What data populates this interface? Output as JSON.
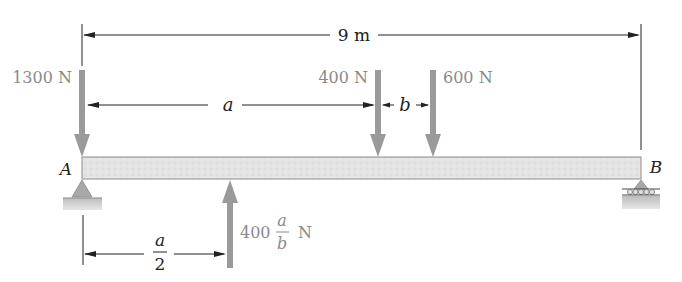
{
  "diagram": {
    "type": "simply-supported beam free-body diagram",
    "total_length": {
      "label": "9 m",
      "value": 9,
      "unit": "m"
    },
    "supports": [
      {
        "id": "A",
        "label": "A",
        "type": "pin"
      },
      {
        "id": "B",
        "label": "B",
        "type": "roller"
      }
    ],
    "loads": [
      {
        "id": "F1",
        "label": "1300 N",
        "direction": "down",
        "position": "at A"
      },
      {
        "id": "F2",
        "label": "400 N",
        "direction": "down",
        "position": "a from A"
      },
      {
        "id": "F3",
        "label": "600 N",
        "direction": "down",
        "position": "a + b from A"
      },
      {
        "id": "F4",
        "label_prefix": "400",
        "frac_num": "a",
        "frac_den": "b",
        "label_suffix": "N",
        "direction": "up",
        "position": "a/2 from A"
      }
    ],
    "dimensions": [
      {
        "id": "span",
        "label": "9 m"
      },
      {
        "id": "a",
        "label": "a"
      },
      {
        "id": "b",
        "label": "b"
      },
      {
        "id": "half-a",
        "frac_num": "a",
        "frac_den": "2"
      }
    ]
  },
  "colors": {
    "force_arrow": "#9a9a9a",
    "beam_fill": "#e2e2e2",
    "beam_edge": "#8c8c8c",
    "dim_line": "#222222",
    "label_gray": "#8a8a8a"
  }
}
